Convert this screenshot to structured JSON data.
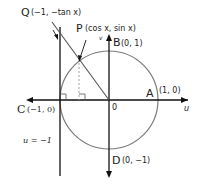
{
  "diagram": {
    "axes": {
      "horizontal_label": "u",
      "vertical_label": "v",
      "origin_label": "0"
    },
    "points": {
      "Q": {
        "name": "Q",
        "coords": "(−1, −tan x)"
      },
      "P": {
        "name": "P",
        "coords": "(cos x, sin x)"
      },
      "A": {
        "name": "A",
        "coords": "(1, 0)"
      },
      "B": {
        "name": "B",
        "coords": "(0, 1)"
      },
      "C": {
        "name": "C",
        "coords": "(−1, 0)"
      },
      "D": {
        "name": "D",
        "coords": "(0, −1)"
      }
    },
    "line_label": "u = −1",
    "colors": {
      "axes": "#111111",
      "circle": "#7a7a7a",
      "dashed": "#999999"
    }
  }
}
